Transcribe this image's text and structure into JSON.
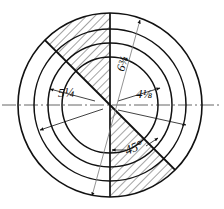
{
  "figure": {
    "type": "engineering-drawing",
    "center": {
      "x": 110,
      "y": 105
    },
    "circles": [
      {
        "name": "inner-circle",
        "radius": 48
      },
      {
        "name": "second-circle",
        "radius": 62
      },
      {
        "name": "third-circle",
        "radius": 76
      },
      {
        "name": "outer-circle",
        "radius": 92
      }
    ],
    "centerline": {
      "style": "dash-dot",
      "orientation": "horizontal"
    },
    "sectors": [
      {
        "name": "upper-hatched-sector",
        "start_deg": 90,
        "end_deg": 135,
        "hatched": true
      },
      {
        "name": "lower-right-hatched-sector",
        "start_deg": 270,
        "end_deg": 315,
        "hatched": true
      }
    ],
    "radial_lines": [
      {
        "name": "vertical-up-line",
        "angle_deg": 90
      },
      {
        "name": "upper-left-diagonal",
        "angle_deg": 135
      },
      {
        "name": "vertical-down-line",
        "angle_deg": 270
      },
      {
        "name": "lower-right-diagonal",
        "angle_deg": 315
      }
    ]
  },
  "labels": {
    "left_diameter": "5¼",
    "right_diameter": "4⅛",
    "diagonal_diameter": "6¾",
    "angle": "45°"
  },
  "colors": {
    "line": "#111111",
    "hatch": "#333333",
    "centerline": "#555555",
    "background": "#ffffff"
  }
}
